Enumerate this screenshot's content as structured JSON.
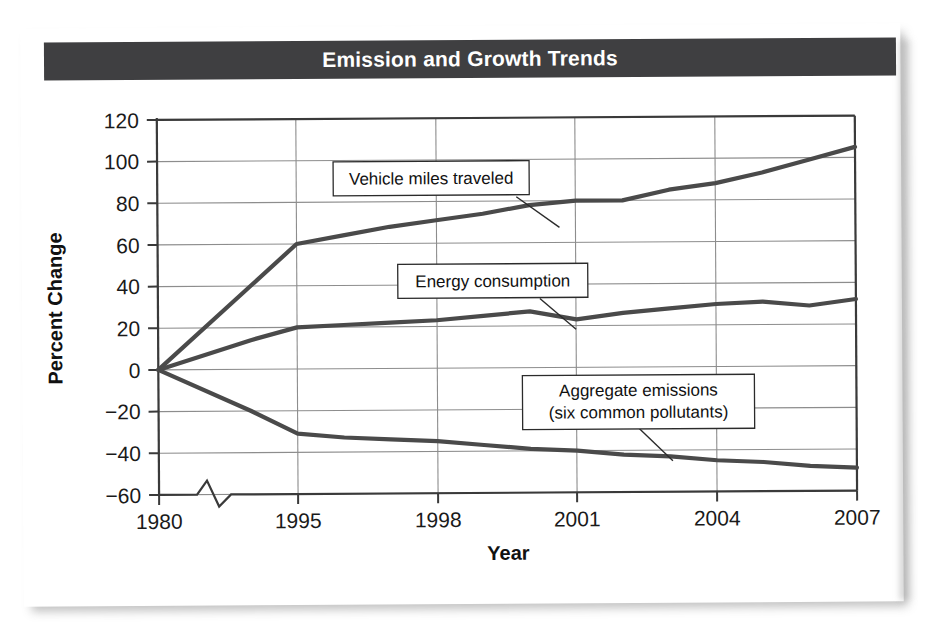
{
  "title": "Emission and Growth Trends",
  "colors": {
    "banner": "#3f3f41",
    "banner_text": "#ffffff",
    "line": "#4a4a4a",
    "grid": "#8d8d8d",
    "axis": "#3a3a3a",
    "text": "#111111",
    "page": "#ffffff"
  },
  "axes": {
    "y_title": "Percent Change",
    "x_title": "Year",
    "y_ticks": [
      "120",
      "100",
      "80",
      "60",
      "40",
      "20",
      "0",
      "−20",
      "−40",
      "−60"
    ],
    "x_ticks": [
      "1980",
      "1995",
      "1998",
      "2001",
      "2004",
      "2007"
    ],
    "axis_break": "zigzag-break"
  },
  "callouts": [
    {
      "id": "vehicle-miles-traveled",
      "lines": [
        "Vehicle miles traveled"
      ]
    },
    {
      "id": "energy-consumption",
      "lines": [
        "Energy consumption"
      ]
    },
    {
      "id": "aggregate-emissions",
      "lines": [
        "Aggregate emissions",
        "(six common pollutants)"
      ]
    }
  ],
  "chart_data": {
    "type": "line",
    "title": "Emission and Growth Trends",
    "xlabel": "Year",
    "ylabel": "Percent Change",
    "xlim": [
      1980,
      2007
    ],
    "ylim": [
      -60,
      120
    ],
    "grid": true,
    "legend": "annotated-callouts",
    "x_tick_values": [
      1980,
      1995,
      1998,
      2001,
      2004,
      2007
    ],
    "y_tick_values": [
      -60,
      -40,
      -20,
      0,
      20,
      40,
      60,
      80,
      100,
      120
    ],
    "axis_break_between": [
      1980,
      1995
    ],
    "series": [
      {
        "name": "Vehicle miles traveled",
        "x": [
          1980,
          1990,
          1995,
          1996,
          1997,
          1998,
          1999,
          2000,
          2001,
          2002,
          2003,
          2004,
          2005,
          2006,
          2007
        ],
        "values": [
          0,
          40,
          60,
          64,
          68,
          71,
          74,
          78,
          80,
          80,
          85,
          88,
          93,
          99,
          105
        ]
      },
      {
        "name": "Energy consumption",
        "x": [
          1980,
          1990,
          1995,
          1996,
          1997,
          1998,
          1999,
          2000,
          2001,
          2002,
          2003,
          2004,
          2005,
          2006,
          2007
        ],
        "values": [
          0,
          14,
          20,
          21,
          22,
          23,
          25,
          27,
          23,
          26,
          28,
          30,
          31,
          29,
          32
        ]
      },
      {
        "name": "Aggregate emissions (six common pollutants)",
        "x": [
          1980,
          1990,
          1995,
          1996,
          1997,
          1998,
          1999,
          2000,
          2001,
          2002,
          2003,
          2004,
          2005,
          2006,
          2007
        ],
        "values": [
          0,
          -20,
          -31,
          -33,
          -34,
          -35,
          -37,
          -39,
          -40,
          -42,
          -43,
          -45,
          -46,
          -48,
          -49
        ]
      }
    ]
  }
}
